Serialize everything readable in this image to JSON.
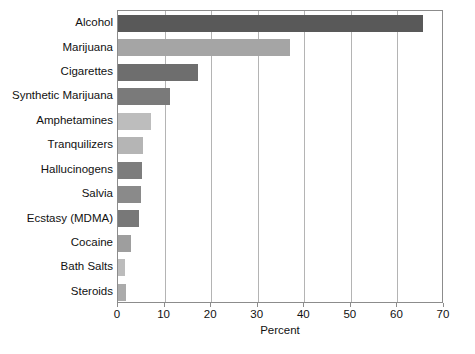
{
  "chart_data": {
    "type": "bar",
    "orientation": "horizontal",
    "title": "",
    "xlabel": "Percent",
    "ylabel": "",
    "xlim": [
      0,
      70
    ],
    "xticks": [
      0,
      10,
      20,
      30,
      40,
      50,
      60,
      70
    ],
    "xtick_labels": [
      "0",
      "10",
      "20",
      "30",
      "40",
      "50",
      "60",
      "70"
    ],
    "grid": "vertical",
    "legend": "none",
    "categories": [
      "Alcohol",
      "Marijuana",
      "Cigarettes",
      "Synthetic Marijuana",
      "Amphetamines",
      "Tranquilizers",
      "Hallucinogens",
      "Salvia",
      "Ecstasy (MDMA)",
      "Cocaine",
      "Bath Salts",
      "Steroids"
    ],
    "values": [
      65.5,
      37,
      17.2,
      11.2,
      7.0,
      5.4,
      5.2,
      4.9,
      4.5,
      2.8,
      1.6,
      1.8
    ],
    "bar_colors": [
      "#595959",
      "#a5a5a5",
      "#6e6e6e",
      "#7a7a7a",
      "#bdbdbd",
      "#b5b5b5",
      "#7d7d7d",
      "#8a8a8a",
      "#787878",
      "#9e9e9e",
      "#bcbcbc",
      "#ababab"
    ]
  },
  "axis": {
    "frame_color": "#8c8c8c",
    "gridline_color": "#b4b4b4"
  }
}
